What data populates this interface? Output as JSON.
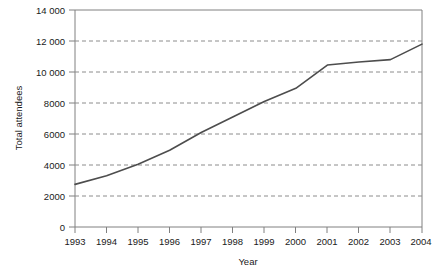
{
  "chart_data": {
    "type": "line",
    "title": "",
    "xlabel": "Year",
    "ylabel": "Total attendees",
    "x": [
      1993,
      1994,
      1995,
      1996,
      1997,
      1998,
      1999,
      2000,
      2001,
      2002,
      2003,
      2004
    ],
    "categories": [
      "1993",
      "1994",
      "1995",
      "1996",
      "1997",
      "1998",
      "1999",
      "2000",
      "2001",
      "2002",
      "2003",
      "2004"
    ],
    "series": [
      {
        "name": "Total attendees",
        "color": "#4d4d4d",
        "values": [
          2750,
          3300,
          4050,
          4950,
          6100,
          7100,
          8100,
          8950,
          10450,
          10650,
          10800,
          11800
        ]
      }
    ],
    "xlim": [
      1993,
      2004
    ],
    "ylim": [
      0,
      14000
    ],
    "xticks": [
      "1993",
      "1994",
      "1995",
      "1996",
      "1997",
      "1998",
      "1999",
      "2000",
      "2001",
      "2002",
      "2003",
      "2004"
    ],
    "yticks": [
      "0",
      "2000",
      "4000",
      "6000",
      "8000",
      "10 000",
      "12 000",
      "14 000"
    ],
    "ytick_values": [
      0,
      2000,
      4000,
      6000,
      8000,
      10000,
      12000,
      14000
    ],
    "grid": "horizontal-dashed",
    "gridline_values": [
      2000,
      4000,
      6000,
      8000,
      10000,
      12000
    ],
    "grid_color": "#8c8c8c",
    "axis_color": "#808080",
    "legend": "none",
    "legend_position": "none",
    "annotations": []
  }
}
